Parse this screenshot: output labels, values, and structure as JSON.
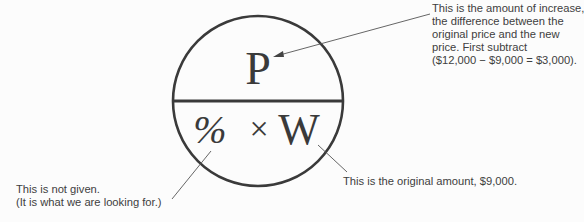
{
  "diagram": {
    "circle": {
      "top_label": "P",
      "bottom_label_percent": "%",
      "bottom_label_times": "×",
      "bottom_label_whole": "W"
    },
    "annotations": {
      "part": [
        "This is the amount of increase,",
        "the difference between the",
        "original price and the new",
        "price. First subtract",
        "($12,000 − $9,000 = $3,000)."
      ],
      "whole": [
        "This is the original amount, $9,000."
      ],
      "percent": [
        "This is not given.",
        "(It is what we are looking for.)"
      ]
    },
    "colors": {
      "ink": "#3a3a3a",
      "background": "#fcfcfc"
    }
  }
}
